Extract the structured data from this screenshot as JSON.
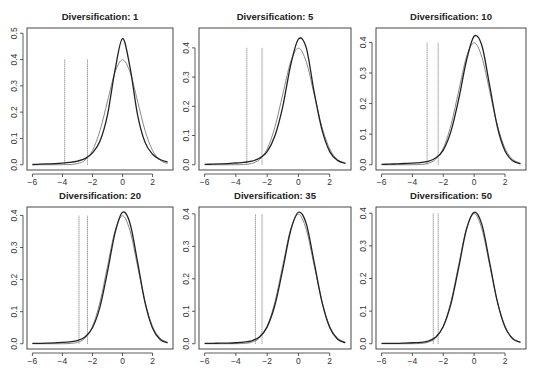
{
  "chart_data": [
    {
      "type": "line",
      "title": "Diversification: 1",
      "xlabel": "",
      "ylabel": "",
      "xlim": [
        -6,
        3
      ],
      "ylim": [
        0,
        0.5
      ],
      "xticks": [
        -6,
        -4,
        -2,
        0,
        2
      ],
      "yticks": [
        0.0,
        0.1,
        0.2,
        0.3,
        0.4,
        0.5
      ],
      "grid": false,
      "x": [
        -6,
        -5.5,
        -5,
        -4.5,
        -4,
        -3.5,
        -3,
        -2.5,
        -2,
        -1.5,
        -1,
        -0.5,
        0,
        0.5,
        1,
        1.5,
        2,
        2.5,
        3
      ],
      "series": [
        {
          "name": "empirical density",
          "color": "#222222",
          "values": [
            0.001,
            0.002,
            0.003,
            0.004,
            0.006,
            0.009,
            0.014,
            0.023,
            0.045,
            0.09,
            0.19,
            0.36,
            0.48,
            0.37,
            0.19,
            0.085,
            0.04,
            0.02,
            0.01
          ]
        },
        {
          "name": "normal density",
          "color": "#888888",
          "values": [
            0.0,
            0.0,
            0.0,
            0.0,
            0.0001,
            0.0009,
            0.0044,
            0.0175,
            0.054,
            0.13,
            0.242,
            0.352,
            0.399,
            0.352,
            0.242,
            0.13,
            0.054,
            0.0175,
            0.0044
          ]
        }
      ],
      "vlines": [
        {
          "x": -3.85,
          "ymax": 0.4
        },
        {
          "x": -2.33,
          "ymax": 0.4
        }
      ]
    },
    {
      "type": "line",
      "title": "Diversification: 5",
      "xlabel": "",
      "ylabel": "",
      "xlim": [
        -6,
        3
      ],
      "ylim": [
        0,
        0.45
      ],
      "xticks": [
        -6,
        -4,
        -2,
        0,
        2
      ],
      "yticks": [
        0.0,
        0.1,
        0.2,
        0.3,
        0.4
      ],
      "grid": false,
      "x": [
        -6,
        -5.5,
        -5,
        -4.5,
        -4,
        -3.5,
        -3,
        -2.5,
        -2,
        -1.5,
        -1,
        -0.5,
        0,
        0.5,
        1,
        1.5,
        2,
        2.5,
        3
      ],
      "series": [
        {
          "name": "empirical density",
          "color": "#222222",
          "values": [
            0.001,
            0.002,
            0.003,
            0.004,
            0.006,
            0.008,
            0.012,
            0.022,
            0.045,
            0.1,
            0.2,
            0.34,
            0.43,
            0.4,
            0.25,
            0.12,
            0.045,
            0.015,
            0.005
          ]
        },
        {
          "name": "normal density",
          "color": "#888888",
          "values": [
            0.0,
            0.0,
            0.0,
            0.0,
            0.0001,
            0.0009,
            0.0044,
            0.0175,
            0.054,
            0.13,
            0.242,
            0.352,
            0.399,
            0.352,
            0.242,
            0.13,
            0.054,
            0.0175,
            0.0044
          ]
        }
      ],
      "vlines": [
        {
          "x": -3.3,
          "ymax": 0.4
        },
        {
          "x": -2.33,
          "ymax": 0.4
        }
      ]
    },
    {
      "type": "line",
      "title": "Diversification: 10",
      "xlabel": "",
      "ylabel": "",
      "xlim": [
        -6,
        3
      ],
      "ylim": [
        0,
        0.43
      ],
      "xticks": [
        -6,
        -4,
        -2,
        0,
        2
      ],
      "yticks": [
        0.0,
        0.1,
        0.2,
        0.3,
        0.4
      ],
      "grid": false,
      "x": [
        -6,
        -5.5,
        -5,
        -4.5,
        -4,
        -3.5,
        -3,
        -2.5,
        -2,
        -1.5,
        -1,
        -0.5,
        0,
        0.5,
        1,
        1.5,
        2,
        2.5,
        3
      ],
      "series": [
        {
          "name": "empirical density",
          "color": "#222222",
          "values": [
            0.001,
            0.002,
            0.003,
            0.004,
            0.005,
            0.007,
            0.011,
            0.022,
            0.048,
            0.11,
            0.215,
            0.34,
            0.42,
            0.39,
            0.26,
            0.125,
            0.045,
            0.013,
            0.003
          ]
        },
        {
          "name": "normal density",
          "color": "#888888",
          "values": [
            0.0,
            0.0,
            0.0,
            0.0,
            0.0001,
            0.0009,
            0.0044,
            0.0175,
            0.054,
            0.13,
            0.242,
            0.352,
            0.399,
            0.352,
            0.242,
            0.13,
            0.054,
            0.0175,
            0.0044
          ]
        }
      ],
      "vlines": [
        {
          "x": -3.05,
          "ymax": 0.4
        },
        {
          "x": -2.33,
          "ymax": 0.4
        }
      ]
    },
    {
      "type": "line",
      "title": "Diversification: 20",
      "xlabel": "",
      "ylabel": "",
      "xlim": [
        -6,
        3
      ],
      "ylim": [
        0,
        0.41
      ],
      "xticks": [
        -6,
        -4,
        -2,
        0,
        2
      ],
      "yticks": [
        0.0,
        0.1,
        0.2,
        0.3,
        0.4
      ],
      "grid": false,
      "x": [
        -6,
        -5.5,
        -5,
        -4.5,
        -4,
        -3.5,
        -3,
        -2.5,
        -2,
        -1.5,
        -1,
        -0.5,
        0,
        0.5,
        1,
        1.5,
        2,
        2.5,
        3
      ],
      "series": [
        {
          "name": "empirical density",
          "color": "#222222",
          "values": [
            0.001,
            0.001,
            0.002,
            0.003,
            0.004,
            0.006,
            0.01,
            0.021,
            0.05,
            0.115,
            0.225,
            0.345,
            0.41,
            0.375,
            0.255,
            0.128,
            0.048,
            0.013,
            0.003
          ]
        },
        {
          "name": "normal density",
          "color": "#888888",
          "values": [
            0.0,
            0.0,
            0.0,
            0.0,
            0.0001,
            0.0009,
            0.0044,
            0.0175,
            0.054,
            0.13,
            0.242,
            0.352,
            0.399,
            0.352,
            0.242,
            0.13,
            0.054,
            0.0175,
            0.0044
          ]
        }
      ],
      "vlines": [
        {
          "x": -2.9,
          "ymax": 0.4
        },
        {
          "x": -2.33,
          "ymax": 0.4
        }
      ]
    },
    {
      "type": "line",
      "title": "Diversification: 35",
      "xlabel": "",
      "ylabel": "",
      "xlim": [
        -6,
        3
      ],
      "ylim": [
        0,
        0.405
      ],
      "xticks": [
        -6,
        -4,
        -2,
        0,
        2
      ],
      "yticks": [
        0.0,
        0.1,
        0.2,
        0.3,
        0.4
      ],
      "grid": false,
      "x": [
        -6,
        -5.5,
        -5,
        -4.5,
        -4,
        -3.5,
        -3,
        -2.5,
        -2,
        -1.5,
        -1,
        -0.5,
        0,
        0.5,
        1,
        1.5,
        2,
        2.5,
        3
      ],
      "series": [
        {
          "name": "empirical density",
          "color": "#222222",
          "values": [
            0.001,
            0.001,
            0.002,
            0.002,
            0.003,
            0.005,
            0.009,
            0.021,
            0.052,
            0.12,
            0.23,
            0.348,
            0.405,
            0.37,
            0.252,
            0.13,
            0.05,
            0.014,
            0.003
          ]
        },
        {
          "name": "normal density",
          "color": "#888888",
          "values": [
            0.0,
            0.0,
            0.0,
            0.0,
            0.0001,
            0.0009,
            0.0044,
            0.0175,
            0.054,
            0.13,
            0.242,
            0.352,
            0.399,
            0.352,
            0.242,
            0.13,
            0.054,
            0.0175,
            0.0044
          ]
        }
      ],
      "vlines": [
        {
          "x": -2.75,
          "ymax": 0.4
        },
        {
          "x": -2.33,
          "ymax": 0.4
        }
      ]
    },
    {
      "type": "line",
      "title": "Diversification: 50",
      "xlabel": "",
      "ylabel": "",
      "xlim": [
        -6,
        3
      ],
      "ylim": [
        0,
        0.403
      ],
      "xticks": [
        -6,
        -4,
        -2,
        0,
        2
      ],
      "yticks": [
        0.0,
        0.1,
        0.2,
        0.3,
        0.4
      ],
      "grid": false,
      "x": [
        -6,
        -5.5,
        -5,
        -4.5,
        -4,
        -3.5,
        -3,
        -2.5,
        -2,
        -1.5,
        -1,
        -0.5,
        0,
        0.5,
        1,
        1.5,
        2,
        2.5,
        3
      ],
      "series": [
        {
          "name": "empirical density",
          "color": "#222222",
          "values": [
            0.001,
            0.001,
            0.001,
            0.002,
            0.003,
            0.004,
            0.008,
            0.02,
            0.053,
            0.123,
            0.234,
            0.35,
            0.403,
            0.366,
            0.25,
            0.13,
            0.051,
            0.015,
            0.004
          ]
        },
        {
          "name": "normal density",
          "color": "#888888",
          "values": [
            0.0,
            0.0,
            0.0,
            0.0,
            0.0001,
            0.0009,
            0.0044,
            0.0175,
            0.054,
            0.13,
            0.242,
            0.352,
            0.399,
            0.352,
            0.242,
            0.13,
            0.054,
            0.0175,
            0.0044
          ]
        }
      ],
      "vlines": [
        {
          "x": -2.65,
          "ymax": 0.4
        },
        {
          "x": -2.33,
          "ymax": 0.4
        }
      ]
    }
  ]
}
